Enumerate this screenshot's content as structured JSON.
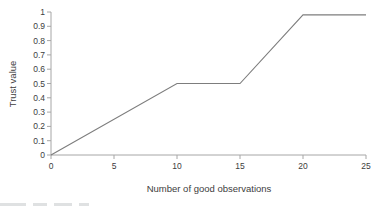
{
  "chart_data": {
    "type": "line",
    "title": "",
    "xlabel": "Number of good observations",
    "ylabel": "Trust value",
    "xlim": [
      0,
      25
    ],
    "ylim": [
      0,
      1
    ],
    "grid": false,
    "legend": "none",
    "axis_color": "#a6a6a6",
    "text_color": "#3d3d3d",
    "x_ticks": [
      {
        "value": 0,
        "label": "0"
      },
      {
        "value": 5,
        "label": "5"
      },
      {
        "value": 10,
        "label": "10"
      },
      {
        "value": 15,
        "label": "15"
      },
      {
        "value": 20,
        "label": "20"
      },
      {
        "value": 25,
        "label": "25"
      }
    ],
    "y_ticks": [
      {
        "value": 0,
        "label": "0"
      },
      {
        "value": 0.1,
        "label": "0.1"
      },
      {
        "value": 0.2,
        "label": "0.2"
      },
      {
        "value": 0.3,
        "label": "0.3"
      },
      {
        "value": 0.4,
        "label": "0.4"
      },
      {
        "value": 0.5,
        "label": "0.5"
      },
      {
        "value": 0.6,
        "label": "0.6"
      },
      {
        "value": 0.7,
        "label": "0.7"
      },
      {
        "value": 0.8,
        "label": "0.8"
      },
      {
        "value": 0.9,
        "label": "0.9"
      },
      {
        "value": 1,
        "label": "1"
      }
    ],
    "series": [
      {
        "name": "trust-value",
        "color": "#7d7d7d",
        "points": [
          [
            0,
            0
          ],
          [
            10,
            0.5
          ],
          [
            15,
            0.5
          ],
          [
            20,
            0.98
          ],
          [
            25,
            0.98
          ]
        ]
      }
    ]
  }
}
